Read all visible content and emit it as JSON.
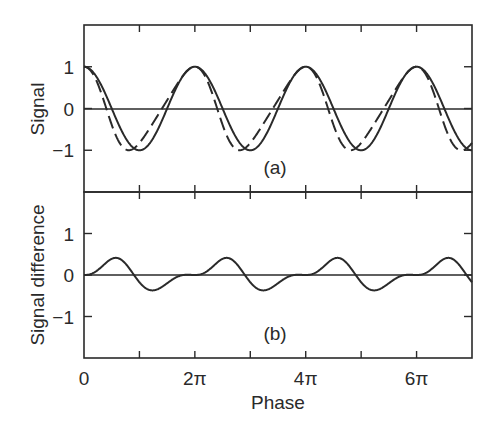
{
  "chart_data": {
    "type": "line",
    "layout": "two vertically stacked panels sharing x-axis",
    "xlabel": "Phase",
    "xlim_pi": [
      0,
      7
    ],
    "x_ticks_pi": [
      0,
      1,
      2,
      3,
      4,
      5,
      6,
      7
    ],
    "x_tick_labels": [
      {
        "pi": 0,
        "label": "0"
      },
      {
        "pi": 2,
        "label": "2π"
      },
      {
        "pi": 4,
        "label": "4π"
      },
      {
        "pi": 6,
        "label": "6π"
      }
    ],
    "grid": false,
    "legend": null,
    "panels": [
      {
        "id": "a",
        "label": "(a)",
        "ylabel": "Signal",
        "ylim": [
          -2,
          2
        ],
        "y_ticks": [
          1,
          0,
          -1
        ],
        "y_tick_labels": [
          "1",
          "0",
          "−1"
        ],
        "zero_line": true,
        "series": [
          {
            "name": "Signal (solid)",
            "style": "solid",
            "formula": "cos(phase)",
            "sample_phase_pi": [
              0,
              0.1667,
              0.3333,
              0.5,
              0.6667,
              0.8333,
              1,
              1.1667,
              1.3333,
              1.5,
              1.6667,
              1.8333,
              2
            ],
            "values_one_period": [
              1,
              0.866,
              0.5,
              0,
              -0.5,
              -0.866,
              -1,
              -0.866,
              -0.5,
              0,
              0.5,
              0.866,
              1
            ]
          },
          {
            "name": "Signal (dashed)",
            "style": "dashed",
            "formula": "cos(phase + 0.3*(1 - cos(phase)) + 0.1*sin(phase))",
            "phase_mod": {
              "a": 0.3,
              "b": 0.1
            },
            "sample_phase_pi": [
              0,
              0.1667,
              0.3333,
              0.5,
              0.6667,
              0.8333,
              1,
              1.1667,
              1.3333,
              1.5,
              1.6667,
              1.8333,
              2
            ],
            "values_one_period": [
              1,
              0.817,
              0.283,
              -0.389,
              -0.872,
              -0.997,
              -0.825,
              -0.512,
              -0.16,
              0.199,
              0.554,
              0.861,
              1
            ]
          }
        ]
      },
      {
        "id": "b",
        "label": "(b)",
        "ylabel": "Signal difference",
        "ylim": [
          -2,
          2
        ],
        "y_ticks": [
          1,
          0,
          -1
        ],
        "y_tick_labels": [
          "1",
          "0",
          "−1"
        ],
        "zero_line": true,
        "series": [
          {
            "name": "Signal difference (solid − dashed)",
            "style": "solid",
            "sample_phase_pi": [
              0,
              0.1667,
              0.3333,
              0.5,
              0.6667,
              0.8333,
              1,
              1.1667,
              1.3333,
              1.5,
              1.6667,
              1.8333,
              2
            ],
            "values_one_period": [
              0,
              0.049,
              0.217,
              0.389,
              0.372,
              0.131,
              -0.175,
              -0.354,
              -0.34,
              -0.199,
              -0.054,
              0.005,
              0
            ],
            "peak_approx": {
              "phase_pi": 0.67,
              "value": 0.42
            },
            "trough_approx": {
              "phase_pi": 1.48,
              "value": -0.36
            }
          }
        ]
      }
    ]
  },
  "colors": {
    "ink": "#2a2a2a",
    "background": "#ffffff"
  }
}
